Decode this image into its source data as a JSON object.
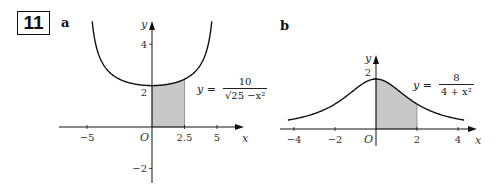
{
  "question_number": "11",
  "chart_data": [
    {
      "panel": "a",
      "type": "line",
      "function": "y = 10 / sqrt(25 - x^2)",
      "equation_label": {
        "lhs": "y =",
        "numerator": "10",
        "denominator": "√25 −x²"
      },
      "xlabel": "x",
      "ylabel": "y",
      "origin_label": "O",
      "x_ticks": [
        -5,
        2.5,
        5
      ],
      "x_tick_labels": [
        "−5",
        "2.5",
        "5"
      ],
      "y_ticks": [
        -2,
        2,
        4
      ],
      "y_tick_labels": [
        "−2",
        "2",
        "4"
      ],
      "xlim": [
        -6,
        6.5
      ],
      "ylim": [
        -2.5,
        5.2
      ],
      "curve_x_range": [
        -4.6,
        4.6
      ],
      "shaded_region": {
        "from": 0,
        "to": 2.5,
        "color": "#c8c8c8"
      },
      "grid": false
    },
    {
      "panel": "b",
      "type": "line",
      "function": "y = 8 / (4 + x^2)",
      "equation_label": {
        "lhs": "y =",
        "numerator": "8",
        "denominator": "4 + x²"
      },
      "xlabel": "x",
      "ylabel": "y",
      "origin_label": "O",
      "x_ticks": [
        -4,
        -2,
        2,
        4
      ],
      "x_tick_labels": [
        "−4",
        "−2",
        "2",
        "4"
      ],
      "y_ticks": [
        2
      ],
      "y_tick_labels": [
        "2"
      ],
      "xlim": [
        -4.5,
        4.9
      ],
      "ylim": [
        -0.5,
        2.6
      ],
      "curve_x_range": [
        -4.3,
        4.3
      ],
      "shaded_region": {
        "from": 0,
        "to": 2,
        "color": "#c8c8c8"
      },
      "grid": false
    }
  ],
  "panels": {
    "a": {
      "label": "a"
    },
    "b": {
      "label": "b"
    }
  }
}
